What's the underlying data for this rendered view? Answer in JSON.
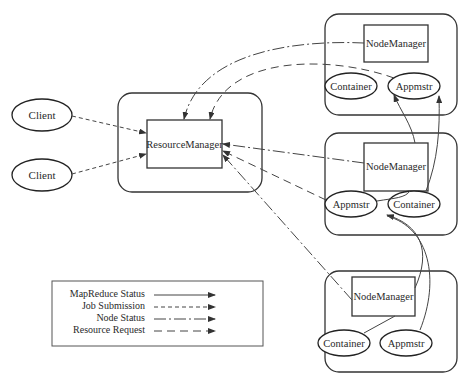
{
  "diagram": {
    "type": "architecture",
    "title": "",
    "clients": [
      {
        "id": "client1",
        "label": "Client"
      },
      {
        "id": "client2",
        "label": "Client"
      }
    ],
    "resource_manager": {
      "label": "ResourceManager"
    },
    "nodes": [
      {
        "id": "node1",
        "node_manager": "NodeManager",
        "children": [
          {
            "label": "Container"
          },
          {
            "label": "Appmstr"
          }
        ]
      },
      {
        "id": "node2",
        "node_manager": "NodeManager",
        "children": [
          {
            "label": "Appmstr"
          },
          {
            "label": "Container"
          }
        ]
      },
      {
        "id": "node3",
        "node_manager": "NodeManager",
        "children": [
          {
            "label": "Container"
          },
          {
            "label": "Appmstr"
          }
        ]
      }
    ],
    "edges": [
      {
        "from": "client1",
        "to": "ResourceManager",
        "style": "Job Submission"
      },
      {
        "from": "client2",
        "to": "ResourceManager",
        "style": "Job Submission"
      },
      {
        "from": "node1.NodeManager",
        "to": "ResourceManager",
        "style": "Node Status"
      },
      {
        "from": "node1.Appmstr",
        "to": "ResourceManager",
        "style": "Resource Request"
      },
      {
        "from": "node2.NodeManager",
        "to": "ResourceManager",
        "style": "Node Status"
      },
      {
        "from": "node2.Appmstr",
        "to": "ResourceManager",
        "style": "Resource Request"
      },
      {
        "from": "node3.NodeManager",
        "to": "ResourceManager",
        "style": "Node Status"
      },
      {
        "from": "node2.NodeManager",
        "to": "node1.Container",
        "style": "MapReduce Status"
      },
      {
        "from": "node2.Container",
        "to": "node1.Appmstr",
        "style": "MapReduce Status"
      },
      {
        "from": "node2.NodeManager",
        "to": "node2.Appmstr",
        "style": "MapReduce Status"
      },
      {
        "from": "node3.NodeManager",
        "to": "node2.Appmstr",
        "style": "MapReduce Status"
      },
      {
        "from": "node3.Appmstr",
        "to": "node2.Appmstr",
        "style": "MapReduce Status"
      },
      {
        "from": "node3.NodeManager",
        "to": "node3.Container",
        "style": "MapReduce Status"
      }
    ],
    "legend": {
      "items": [
        {
          "label": "MapReduce Status",
          "style": "solid"
        },
        {
          "label": "Job Submission",
          "style": "short-dash"
        },
        {
          "label": "Node Status",
          "style": "dash-dot"
        },
        {
          "label": "Resource Request",
          "style": "long-dash"
        }
      ]
    },
    "colors": {
      "stroke": "#333333",
      "text": "#2a2a2a",
      "background": "#ffffff"
    }
  }
}
